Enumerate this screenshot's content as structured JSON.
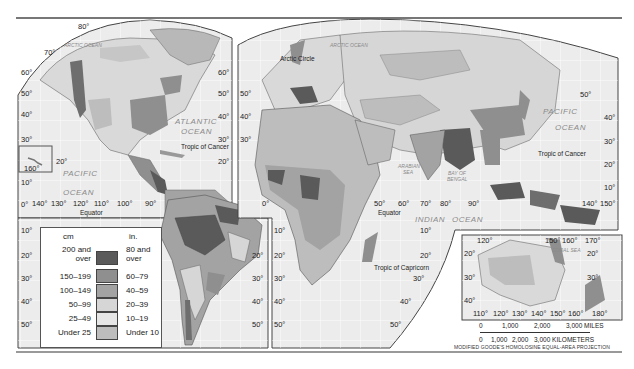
{
  "caption": "average annual precipitation map (caption cropped at top edge)",
  "map": {
    "projection_label": "MODIFIED GOODE'S HOMOLOSINE EQUAL-AREA PROJECTION",
    "oceans": {
      "arctic_na": "ARCTIC OCEAN",
      "arctic_eu": "ARCTIC OCEAN",
      "atlantic_1": "ATLANTIC",
      "atlantic_2": "OCEAN",
      "pacific_w_1": "PACIFIC",
      "pacific_w_2": "OCEAN",
      "pacific_e_1": "PACIFIC",
      "pacific_e_2": "OCEAN",
      "indian_1": "INDIAN",
      "indian_2": "OCEAN",
      "arabian_sea_1": "ARABIAN",
      "arabian_sea_2": "SEA",
      "bay_of_bengal_1": "BAY OF",
      "bay_of_bengal_2": "BENGAL",
      "coral_sea": "CORAL SEA"
    },
    "lines": {
      "arctic_circle": "Arctic Circle",
      "tropic_cancer_w": "Tropic of Cancer",
      "tropic_cancer_e": "Tropic of Cancer",
      "equator_w": "Equator",
      "equator_e": "Equator",
      "tropic_capricorn": "Tropic of Capricorn"
    },
    "lat_labels_left": [
      "60°",
      "50°",
      "40°",
      "30°",
      "20°",
      "10°",
      "0°",
      "10°",
      "20°",
      "30°",
      "40°",
      "50°"
    ],
    "lat_labels_mid_na": [
      "60°",
      "50°",
      "40°",
      "30°",
      "20°"
    ],
    "lat_labels_mid_eu": [
      "60°",
      "50°",
      "40°",
      "30°"
    ],
    "lat_labels_sa_right": [
      "10°",
      "20°",
      "30°",
      "40°",
      "50°"
    ],
    "lat_labels_af_left": [
      "10°",
      "20°",
      "30°",
      "40°",
      "50°"
    ],
    "lat_labels_af_right": [
      "10°",
      "20°",
      "30°",
      "40°",
      "50°"
    ],
    "lat_labels_asia_right": [
      "50°",
      "40°",
      "30°",
      "20°",
      "10°"
    ],
    "lon_labels_na_top": [
      "80°",
      "70°"
    ],
    "lon_labels_pacific": [
      "140°",
      "130°",
      "120°",
      "110°",
      "100°",
      "90°"
    ],
    "lon_labels_indian": [
      "0°",
      "50°",
      "60°",
      "70°",
      "80°",
      "90°"
    ],
    "lon_labels_asia": [
      "140°",
      "150°"
    ],
    "hawaii_labels": [
      "20°",
      "160°"
    ],
    "australia_inset": {
      "top_lon": [
        "120°",
        "150°",
        "160°",
        "170°"
      ],
      "bottom_lon": [
        "110°",
        "120°",
        "130°",
        "140°",
        "150°",
        "160°",
        "180°"
      ],
      "lat_left": [
        "20°",
        "30°",
        "40°"
      ],
      "lat_right": [
        "20°",
        "30°"
      ]
    }
  },
  "legend": {
    "unit_cm": "cm",
    "unit_in": "in.",
    "classes": [
      {
        "cm": "200 and over",
        "cm_1": "200 and",
        "cm_2": "over",
        "in": "80 and over",
        "in_1": "80 and",
        "in_2": "over",
        "color": "#5a5a5a"
      },
      {
        "cm": "150–199",
        "in": "60–79",
        "color": "#8f8f8f"
      },
      {
        "cm": "100–149",
        "in": "40–59",
        "color": "#a3a3a3"
      },
      {
        "cm": "50–99",
        "in": "20–39",
        "color": "#d6d6d6"
      },
      {
        "cm": "25–49",
        "in": "10–19",
        "color": "#e6e6e6"
      },
      {
        "cm": "Under 25",
        "in": "Under 10",
        "color": "#bdbdbd"
      }
    ]
  },
  "scale": {
    "miles_ticks": [
      "0",
      "1,000",
      "2,000",
      "3,000 MILES"
    ],
    "km_ticks": [
      "0",
      "1,000",
      "2,000",
      "3,000 KILOMETERS"
    ]
  },
  "colors": {
    "ocean": "#ececec",
    "grid": "#ffffff",
    "land_base": "#d9d9d9",
    "border": "#555555"
  }
}
